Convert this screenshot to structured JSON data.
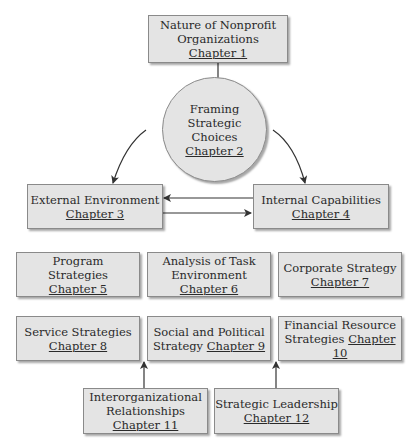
{
  "nodes": {
    "ch1": {
      "title": "Nature of Nonprofit Organizations",
      "line1": "Nature of Nonprofit",
      "line2": "Organizations",
      "chapter": "Chapter 1"
    },
    "ch2": {
      "line1": "Framing",
      "line2": "Strategic",
      "line3": "Choices",
      "chapter": "Chapter 2"
    },
    "ch3": {
      "line1": "External Environment",
      "chapter": "Chapter 3"
    },
    "ch4": {
      "line1": "Internal Capabilities",
      "chapter": "Chapter 4"
    },
    "ch5": {
      "line1": "Program",
      "line2": "Strategies",
      "chapter": "Chapter 5"
    },
    "ch6": {
      "line1": "Analysis of Task",
      "line2": "Environment",
      "chapter": "Chapter 6"
    },
    "ch7": {
      "line1": "Corporate Strategy",
      "chapter": "Chapter 7"
    },
    "ch8": {
      "line1": "Service Strategies",
      "chapter": "Chapter 8"
    },
    "ch9": {
      "line1": "Social and Political",
      "line2": "Strategy",
      "chapter": "Chapter 9"
    },
    "ch10": {
      "line1": "Financial Resource",
      "line2": "Strategies",
      "chapter": "Chapter 10"
    },
    "ch11": {
      "line1": "Interorganizational",
      "line2": "Relationships",
      "chapter": "Chapter 11"
    },
    "ch12": {
      "line1": "Strategic Leadership",
      "chapter": "Chapter 12"
    }
  },
  "edges": [
    {
      "from": "ch1",
      "to": "ch2"
    },
    {
      "from": "ch2",
      "to": "ch3"
    },
    {
      "from": "ch2",
      "to": "ch4"
    },
    {
      "from": "ch4",
      "to": "ch3"
    },
    {
      "from": "ch3",
      "to": "ch4"
    },
    {
      "from": "ch11",
      "to": "ch8-ch9-gap"
    },
    {
      "from": "ch12",
      "to": "ch9-ch10-gap"
    }
  ],
  "colors": {
    "box_fill": "#e4e4e4",
    "border": "#8a8a8a",
    "line": "#333333"
  }
}
